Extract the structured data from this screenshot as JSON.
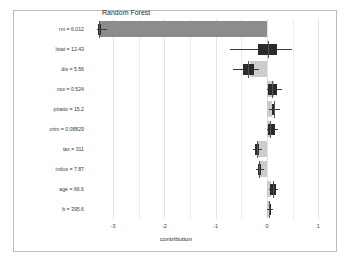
{
  "chart_data": {
    "type": "bar",
    "title": "Random Forest",
    "xlabel": "contribution",
    "ylabel": "",
    "xlim": [
      -3.45,
      1.15
    ],
    "xticks": [
      -3,
      -2,
      -1,
      0,
      1
    ],
    "xticklabels": [
      "-3",
      "-2",
      "-1",
      "0",
      "1"
    ],
    "grid": true,
    "legend": null,
    "categories": [
      "rm = 6.012",
      "lstat = 12.43",
      "dis = 5.56",
      "nox = 0.524",
      "ptratio = 15.2",
      "crim = 0.08829",
      "tax = 311",
      "indus = 7.87",
      "age = 66.6",
      "b = 395.6"
    ],
    "values": [
      -3.27,
      0.02,
      -0.34,
      0.13,
      0.1,
      0.05,
      -0.17,
      -0.13,
      0.08,
      0.04
    ],
    "bars": [
      {
        "label": "rm = 6.012",
        "start": 0,
        "end": -3.27,
        "shade": "dark"
      },
      {
        "label": "lstat = 12.43",
        "start": 0,
        "end": 0.02,
        "shade": "light"
      },
      {
        "label": "dis = 5.56",
        "start": 0,
        "end": -0.34,
        "shade": "light"
      },
      {
        "label": "nox = 0.524",
        "start": 0,
        "end": 0.13,
        "shade": "light"
      },
      {
        "label": "ptratio = 15.2",
        "start": 0,
        "end": 0.1,
        "shade": "light"
      },
      {
        "label": "crim = 0.08829",
        "start": 0,
        "end": 0.05,
        "shade": "light"
      },
      {
        "label": "tax = 311",
        "start": 0,
        "end": -0.17,
        "shade": "light"
      },
      {
        "label": "indus = 7.87",
        "start": 0,
        "end": -0.13,
        "shade": "light"
      },
      {
        "label": "age = 66.6",
        "start": 0,
        "end": 0.08,
        "shade": "light"
      },
      {
        "label": "b = 395.6",
        "start": 0,
        "end": 0.04,
        "shade": "light"
      }
    ],
    "boxplots": [
      {
        "label": "rm = 6.012",
        "whisker_low": -3.31,
        "q1": -3.29,
        "median": -3.27,
        "q3": -3.23,
        "whisker_high": -3.12
      },
      {
        "label": "lstat = 12.43",
        "whisker_low": -0.72,
        "q1": -0.17,
        "median": 0.02,
        "q3": 0.19,
        "whisker_high": 0.49
      },
      {
        "label": "dis = 5.56",
        "whisker_low": -0.66,
        "q1": -0.47,
        "median": -0.37,
        "q3": -0.26,
        "whisker_high": -0.16
      },
      {
        "label": "nox = 0.524",
        "whisker_low": 0.0,
        "q1": 0.02,
        "median": 0.1,
        "q3": 0.2,
        "whisker_high": 0.3
      },
      {
        "label": "ptratio = 15.2",
        "whisker_low": 0.04,
        "q1": 0.1,
        "median": 0.13,
        "q3": 0.16,
        "whisker_high": 0.25
      },
      {
        "label": "crim = 0.08829",
        "whisker_low": 0.0,
        "q1": 0.02,
        "median": 0.06,
        "q3": 0.15,
        "whisker_high": 0.21
      },
      {
        "label": "tax = 311",
        "whisker_low": -0.27,
        "q1": -0.23,
        "median": -0.2,
        "q3": -0.16,
        "whisker_high": -0.1
      },
      {
        "label": "indus = 7.87",
        "whisker_low": -0.21,
        "q1": -0.17,
        "median": -0.15,
        "q3": -0.12,
        "whisker_high": -0.06
      },
      {
        "label": "age = 66.6",
        "whisker_low": 0.03,
        "q1": 0.06,
        "median": 0.11,
        "q3": 0.17,
        "whisker_high": 0.22
      },
      {
        "label": "b = 395.6",
        "whisker_low": 0.0,
        "q1": 0.03,
        "median": 0.04,
        "q3": 0.06,
        "whisker_high": 0.11
      }
    ],
    "colors": {
      "bar_dark": "#8c8c8c",
      "bar_light": "#cccccc",
      "box": "#2b2b2b",
      "whisker": "#3a3a3a",
      "grid": "#ececec",
      "frame": "#bdbdbd",
      "background": "#ffffff",
      "text": "#3a3a3a"
    }
  }
}
